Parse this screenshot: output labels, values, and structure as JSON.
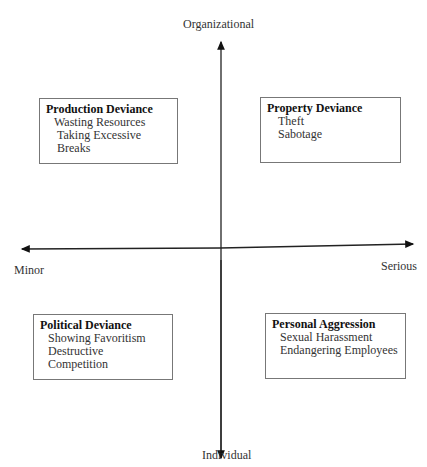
{
  "axes": {
    "top": "Organizational",
    "bottom": "Individual",
    "left": "Minor",
    "right": "Serious"
  },
  "quadrants": [
    {
      "title": "Production Deviance",
      "items": [
        "Wasting Resources",
        "Taking Excessive Breaks"
      ]
    },
    {
      "title": "Property Deviance",
      "items": [
        "Theft",
        "Sabotage"
      ]
    },
    {
      "title": "Political Deviance",
      "items": [
        "Showing Favoritism",
        "Destructive Competition"
      ]
    },
    {
      "title": "Personal Aggression",
      "items": [
        "Sexual Harassment",
        "Endangering Employees"
      ]
    }
  ]
}
